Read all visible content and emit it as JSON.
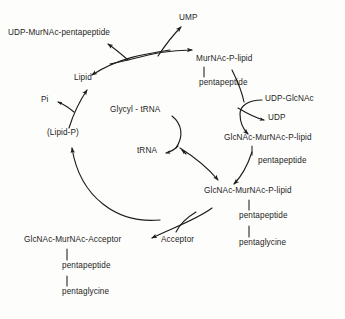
{
  "diagram": {
    "background_color": "#fdfdfb",
    "ink_color": "#1d1d1d",
    "nodes": {
      "udp_murnac_pentapeptide": "UDP-MurNAc-pentapeptide",
      "ump": "UMP",
      "murnac_p_lipid": "MurNAc-P-lipid",
      "murnac_pentapeptide_branch": "pentapeptide",
      "lipid": "Lipid",
      "pi": "Pi",
      "lipid_p": "(Lipid-P)",
      "glycyl_trna": "Glycyl - tRNA",
      "trna": "tRNA",
      "udp_glcnac": "UDP-GlcNAc",
      "udp": "UDP",
      "glcnac_murnac_p_lipid_upper": "GlcNAc-MurNAc-P-lipid",
      "glcnac_upper_pentapeptide": "pentapeptide",
      "glcnac_murnac_p_lipid_lower": "GlcNAc-MurNAc-P-lipid",
      "glcnac_lower_pentapeptide": "pentapeptide",
      "glcnac_lower_pentaglycine": "pentaglycine",
      "acceptor": "Acceptor",
      "glcnac_murnac_acceptor": "GlcNAc-MurNAc-Acceptor",
      "acceptor_pentapeptide": "pentapeptide",
      "acceptor_pentaglycine": "pentaglycine"
    }
  }
}
